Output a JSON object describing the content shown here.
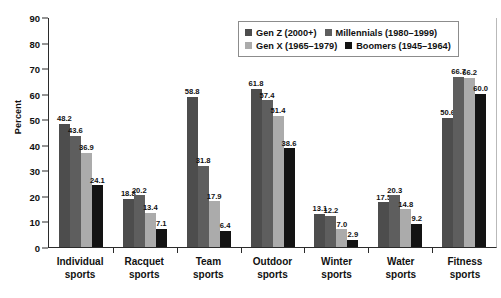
{
  "chart_data": {
    "type": "bar",
    "title": "",
    "xlabel": "",
    "ylabel": "Percent",
    "ylim": [
      0,
      90
    ],
    "yticks": [
      0,
      10,
      20,
      30,
      40,
      50,
      60,
      70,
      80,
      90
    ],
    "grid": false,
    "legend_position": "top-right",
    "categories": [
      "Individual sports",
      "Racquet sports",
      "Team sports",
      "Outdoor sports",
      "Winter sports",
      "Water sports",
      "Fitness sports"
    ],
    "category_lines": [
      [
        "Individual",
        "sports"
      ],
      [
        "Racquet",
        "sports"
      ],
      [
        "Team",
        "sports"
      ],
      [
        "Outdoor",
        "sports"
      ],
      [
        "Winter",
        "sports"
      ],
      [
        "Water",
        "sports"
      ],
      [
        "Fitness",
        "sports"
      ]
    ],
    "series": [
      {
        "name": "Gen Z (2000+)",
        "color": "#4d4d4d",
        "values": [
          48.2,
          18.8,
          58.8,
          61.8,
          13.1,
          17.5,
          50.6
        ],
        "labels": [
          "48.2",
          "18.8",
          "58.8",
          "61.8",
          "13.1",
          "17.5",
          "50.6"
        ]
      },
      {
        "name": "Millennials (1980–1999)",
        "color": "#5e5e5e",
        "values": [
          43.6,
          20.2,
          31.8,
          57.4,
          12.2,
          20.3,
          66.7
        ],
        "labels": [
          "43.6",
          "20.2",
          "31.8",
          "57.4",
          "12.2",
          "20.3",
          "66.7"
        ]
      },
      {
        "name": "Gen X (1965–1979)",
        "color": "#ababab",
        "values": [
          36.9,
          13.4,
          17.9,
          51.4,
          7.0,
          14.8,
          66.2
        ],
        "labels": [
          "36.9",
          "13.4",
          "17.9",
          "51.4",
          "7.0",
          "14.8",
          "66.2"
        ]
      },
      {
        "name": "Boomers (1945–1964)",
        "color": "#131313",
        "values": [
          24.1,
          7.1,
          6.4,
          38.6,
          2.9,
          9.2,
          60.0
        ],
        "labels": [
          "24.1",
          "7.1",
          "6.4",
          "38.6",
          "2.9",
          "9.2",
          "60.0"
        ]
      }
    ]
  },
  "legend": {
    "items": [
      {
        "label": "Gen Z (2000+)",
        "color": "#4d4d4d"
      },
      {
        "label": "Millennials (1980–1999)",
        "color": "#5e5e5e"
      },
      {
        "label": "Gen X (1965–1979)",
        "color": "#ababab"
      },
      {
        "label": "Boomers (1945–1964)",
        "color": "#131313"
      }
    ]
  }
}
